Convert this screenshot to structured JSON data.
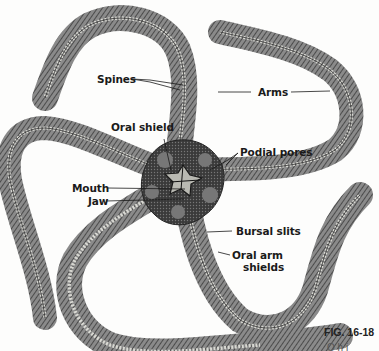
{
  "figure": {
    "number": "FIG. 16-18",
    "caption_partial": "O  h  i"
  },
  "labels": {
    "spines": "Spines",
    "arms": "Arms",
    "oral_shield": "Oral shield",
    "podial_pores": "Podial pores",
    "mouth": "Mouth",
    "jaw": "Jaw",
    "bursal_slits": "Bursal slits",
    "oral_arm_shields_line1": "Oral arm",
    "oral_arm_shields_line2": "shields"
  },
  "colors": {
    "background": "#fdfdfc",
    "arm_dark": "#3a3a3a",
    "arm_mid": "#6e6e6e",
    "ossicle": "#d8d8d2",
    "disc": "#2e2e2e",
    "leader": "#1a1a1a"
  }
}
